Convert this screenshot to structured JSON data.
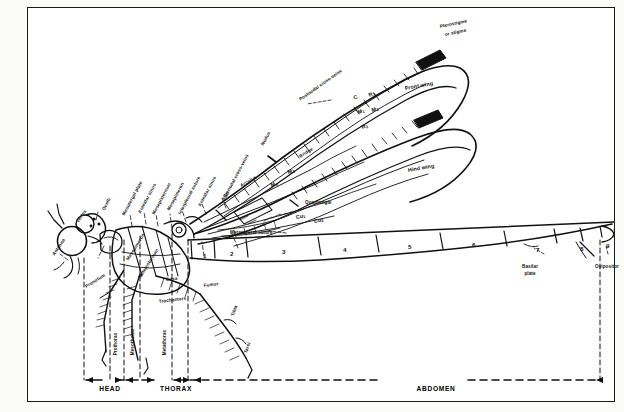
{
  "figure": {
    "kind": "scientific-illustration",
    "frame_color": "#1a1a1a",
    "ink_color": "#111111",
    "paper_color": "#ffffff"
  },
  "head_labels": [
    {
      "id": "antenna",
      "text": "Antenna",
      "x": 26,
      "y": 245,
      "rot": -56,
      "size": "s5"
    },
    {
      "id": "vertex",
      "text": "Vertex",
      "x": 50,
      "y": 212,
      "rot": -56,
      "size": "s5"
    },
    {
      "id": "ocelli",
      "text": "Ocelli",
      "x": 76,
      "y": 200,
      "rot": -62,
      "size": "s5"
    },
    {
      "id": "pronotum",
      "text": "Pronotum",
      "x": 58,
      "y": 277,
      "rot": -32,
      "size": "s5"
    }
  ],
  "thorax_labels": [
    {
      "id": "mesotergal-plate",
      "text": "Mesotergal plate",
      "x": 96,
      "y": 205,
      "rot": -62,
      "size": "s5"
    },
    {
      "id": "antealar-sinus-left",
      "text": "Antealar sinus",
      "x": 112,
      "y": 203,
      "rot": -62,
      "size": "s5"
    },
    {
      "id": "mesepisternum-1",
      "text": "Mesepisternum",
      "x": 126,
      "y": 204,
      "rot": -62,
      "size": "s5"
    },
    {
      "id": "mesepimeron-1",
      "text": "Mesepimeron",
      "x": 141,
      "y": 200,
      "rot": -62,
      "size": "s5"
    },
    {
      "id": "interpleural-suture",
      "text": "Interpleural suture",
      "x": 152,
      "y": 204,
      "rot": -62,
      "size": "s5"
    },
    {
      "id": "antealar-sinus",
      "text": "Antealar sinus",
      "x": 172,
      "y": 196,
      "rot": -62,
      "size": "s5"
    },
    {
      "id": "antenodal-crossveins",
      "text": "Antenodal cross-veins",
      "x": 196,
      "y": 190,
      "rot": -62,
      "size": "s5"
    },
    {
      "id": "mesepimeron-2",
      "text": "Mesepimeron",
      "x": 100,
      "y": 250,
      "rot": -58,
      "size": "s5"
    },
    {
      "id": "metepisternum",
      "text": "Metepisternum",
      "x": 112,
      "y": 268,
      "rot": -58,
      "size": "s5"
    },
    {
      "id": "sc",
      "text": "Sc",
      "x": 197,
      "y": 187,
      "rot": -60,
      "size": "s6"
    },
    {
      "id": "arculus",
      "text": "Arculus",
      "x": 213,
      "y": 176,
      "rot": -30,
      "size": "s5"
    },
    {
      "id": "metapleural-suture",
      "text": "Metapleural suture",
      "x": 202,
      "y": 223,
      "rot": 0,
      "size": "s5"
    }
  ],
  "leg_labels": [
    {
      "id": "coxa",
      "text": "Coxa",
      "x": 138,
      "y": 270,
      "rot": -7,
      "size": "s5"
    },
    {
      "id": "trochanters",
      "text": "Trochanters",
      "x": 131,
      "y": 292,
      "rot": -7,
      "size": "s5"
    },
    {
      "id": "femur",
      "text": "Femur",
      "x": 176,
      "y": 276,
      "rot": -7,
      "size": "s5"
    },
    {
      "id": "tibia",
      "text": "Tibia",
      "x": 205,
      "y": 306,
      "rot": -70,
      "size": "s5"
    },
    {
      "id": "tarsi",
      "text": "Tarsi",
      "x": 218,
      "y": 343,
      "rot": -70,
      "size": "s5"
    }
  ],
  "wing_labels": [
    {
      "id": "pterostigma",
      "text": "Pterostigma",
      "x": 412,
      "y": 17,
      "rot": -12,
      "size": "s5"
    },
    {
      "id": "or-stigma",
      "text": "or stigma",
      "x": 417,
      "y": 25,
      "rot": -12,
      "size": "s5"
    },
    {
      "id": "postnodal-crossveins",
      "text": "Postnodal cross-veins",
      "x": 272,
      "y": 90,
      "rot": -35,
      "size": "s5"
    },
    {
      "id": "front-wing",
      "text": "Front wing",
      "x": 377,
      "y": 78,
      "rot": -10,
      "size": "s6"
    },
    {
      "id": "hind-wing",
      "text": "Hind wing",
      "x": 380,
      "y": 160,
      "rot": -10,
      "size": "s6"
    },
    {
      "id": "nodus",
      "text": "Nodus",
      "x": 235,
      "y": 135,
      "rot": -62,
      "size": "s5"
    },
    {
      "id": "bridge",
      "text": "Bridge",
      "x": 272,
      "y": 147,
      "rot": -32,
      "size": "s5"
    },
    {
      "id": "quadrangle",
      "text": "Quadrangle",
      "x": 277,
      "y": 193,
      "rot": 0,
      "size": "s5"
    },
    {
      "id": "vein-c",
      "text": "C",
      "x": 326,
      "y": 88,
      "rot": -26,
      "size": "s6"
    },
    {
      "id": "vein-r1",
      "text": "R",
      "sub": "1",
      "x": 341,
      "y": 85,
      "rot": -26,
      "size": "s6"
    },
    {
      "id": "vein-m1",
      "text": "M",
      "sub": "1",
      "x": 330,
      "y": 102,
      "rot": -18,
      "size": "s6"
    },
    {
      "id": "vein-m2",
      "text": "M",
      "sub": "2",
      "x": 344,
      "y": 100,
      "rot": -18,
      "size": "s6"
    },
    {
      "id": "vein-r3",
      "text": "R",
      "sub": "3",
      "x": 334,
      "y": 117,
      "rot": -18,
      "size": "s6"
    },
    {
      "id": "vein-m3",
      "text": "M",
      "sub": "3",
      "x": 260,
      "y": 162,
      "rot": -18,
      "size": "s6"
    },
    {
      "id": "vein-m4",
      "text": "M",
      "sub": "4",
      "x": 243,
      "y": 175,
      "rot": -18,
      "size": "s6"
    },
    {
      "id": "vein-cu1",
      "text": "Cu",
      "sub": "1",
      "x": 268,
      "y": 207,
      "rot": -12,
      "size": "s6"
    },
    {
      "id": "vein-cu2",
      "text": "Cu",
      "sub": "2",
      "x": 286,
      "y": 211,
      "rot": -12,
      "size": "s6"
    }
  ],
  "abdomen": {
    "segment_numbers": [
      "1",
      "2",
      "3",
      "4",
      "5",
      "6",
      "7",
      "8",
      "9",
      "10"
    ],
    "terminal_labels": [
      {
        "id": "basilar-plate",
        "line1": "Basilar",
        "line2": "plate",
        "x": 494,
        "y": 257
      },
      {
        "id": "ovipositor",
        "line1": "Ovipositor",
        "line2": "",
        "x": 567,
        "y": 257
      }
    ]
  },
  "segment_positions": [
    {
      "n": "1",
      "x": 175,
      "y": 245
    },
    {
      "n": "2",
      "x": 202,
      "y": 243
    },
    {
      "n": "3",
      "x": 254,
      "y": 241
    },
    {
      "n": "4",
      "x": 315,
      "y": 239
    },
    {
      "n": "5",
      "x": 380,
      "y": 236
    },
    {
      "n": "6",
      "x": 444,
      "y": 234
    },
    {
      "n": "7",
      "x": 508,
      "y": 239
    },
    {
      "n": "8",
      "x": 552,
      "y": 238
    },
    {
      "n": "9",
      "x": 578,
      "y": 235
    },
    {
      "n": "10",
      "x": 597,
      "y": 218
    }
  ],
  "body_region_brackets": [
    {
      "id": "bracket-head",
      "text": "HEAD",
      "x": 82,
      "y": 380
    },
    {
      "id": "bracket-thorax",
      "text": "THORAX",
      "x": 148,
      "y": 380
    },
    {
      "id": "bracket-abdomen",
      "text": "ABDOMEN",
      "x": 408,
      "y": 380
    }
  ],
  "thorax_segment_labels": [
    {
      "id": "prothorax",
      "text": "Prothorax",
      "x": 88,
      "y": 345,
      "rot": -90
    },
    {
      "id": "mesothorax",
      "text": "Mesothorax",
      "x": 105,
      "y": 345,
      "rot": -90
    },
    {
      "id": "metathorax",
      "text": "Metathorax",
      "x": 137,
      "y": 345,
      "rot": -90
    }
  ]
}
